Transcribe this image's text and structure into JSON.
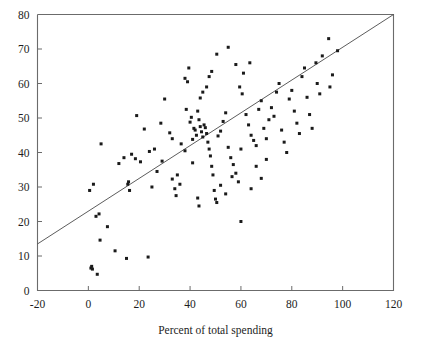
{
  "chart_data": {
    "type": "scatter",
    "title": "",
    "xlabel": "Percent of total spending",
    "ylabel": "",
    "xlim": [
      -20,
      120
    ],
    "ylim": [
      0,
      80
    ],
    "xticks": [
      -20,
      0,
      20,
      40,
      60,
      80,
      100,
      120
    ],
    "yticks": [
      0,
      10,
      20,
      30,
      40,
      50,
      60,
      70,
      80
    ],
    "xtick_labels": [
      "-20",
      "0",
      "20",
      "40",
      "60",
      "80",
      "100",
      "120"
    ],
    "ytick_labels": [
      "0",
      "10",
      "20",
      "30",
      "40",
      "50",
      "60",
      "70",
      "80"
    ],
    "grid": false,
    "legend": false,
    "marker": "square",
    "marker_size": 3,
    "marker_color": "#1a1a1a",
    "axis_color": "#6b6b6b",
    "fit_line": {
      "label": "regression line",
      "color": "#4a4a4a",
      "x0": -20,
      "y0": 13.5,
      "x1": 120,
      "y1": 80.0,
      "slope": 0.475,
      "intercept": 23.0
    },
    "points": [
      [
        0.5,
        29.0
      ],
      [
        1.0,
        6.5
      ],
      [
        1.3,
        7.0
      ],
      [
        1.6,
        6.2
      ],
      [
        2.0,
        30.8
      ],
      [
        3.5,
        4.7
      ],
      [
        3.0,
        21.5
      ],
      [
        4.2,
        22.2
      ],
      [
        4.6,
        14.6
      ],
      [
        5.0,
        42.5
      ],
      [
        7.5,
        18.5
      ],
      [
        10.5,
        11.5
      ],
      [
        12.0,
        36.8
      ],
      [
        14.0,
        38.5
      ],
      [
        15.0,
        9.3
      ],
      [
        15.5,
        30.8
      ],
      [
        15.8,
        31.5
      ],
      [
        16.2,
        29.0
      ],
      [
        17.0,
        39.5
      ],
      [
        18.5,
        38.2
      ],
      [
        19.0,
        50.7
      ],
      [
        20.5,
        37.3
      ],
      [
        22.0,
        46.8
      ],
      [
        23.5,
        9.7
      ],
      [
        24.0,
        40.3
      ],
      [
        26.0,
        41.0
      ],
      [
        28.5,
        48.5
      ],
      [
        30.0,
        55.5
      ],
      [
        32.0,
        45.7
      ],
      [
        33.0,
        32.3
      ],
      [
        34.0,
        29.5
      ],
      [
        34.5,
        27.5
      ],
      [
        35.0,
        33.5
      ],
      [
        36.0,
        30.8
      ],
      [
        38.0,
        61.5
      ],
      [
        38.5,
        52.5
      ],
      [
        39.0,
        60.5
      ],
      [
        39.5,
        64.5
      ],
      [
        40.0,
        48.8
      ],
      [
        40.5,
        50.2
      ],
      [
        41.0,
        43.8
      ],
      [
        41.5,
        47.0
      ],
      [
        42.0,
        46.5
      ],
      [
        42.5,
        45.0
      ],
      [
        43.0,
        52.0
      ],
      [
        43.5,
        49.5
      ],
      [
        44.0,
        47.5
      ],
      [
        44.5,
        46.0
      ],
      [
        45.0,
        44.5
      ],
      [
        45.5,
        48.0
      ],
      [
        46.0,
        47.2
      ],
      [
        46.5,
        45.5
      ],
      [
        47.0,
        43.0
      ],
      [
        47.5,
        41.0
      ],
      [
        48.0,
        39.0
      ],
      [
        48.5,
        36.0
      ],
      [
        49.0,
        33.5
      ],
      [
        49.5,
        29.0
      ],
      [
        50.0,
        26.5
      ],
      [
        50.5,
        25.5
      ],
      [
        44.0,
        55.8
      ],
      [
        45.0,
        57.5
      ],
      [
        46.5,
        59.0
      ],
      [
        47.5,
        62.0
      ],
      [
        48.5,
        63.5
      ],
      [
        51.0,
        44.8
      ],
      [
        52.0,
        46.2
      ],
      [
        53.0,
        49.0
      ],
      [
        54.0,
        51.5
      ],
      [
        55.0,
        41.5
      ],
      [
        56.0,
        38.5
      ],
      [
        57.0,
        36.5
      ],
      [
        58.0,
        34.0
      ],
      [
        59.0,
        31.5
      ],
      [
        60.0,
        20.0
      ],
      [
        59.5,
        59.0
      ],
      [
        60.5,
        57.0
      ],
      [
        61.0,
        63.0
      ],
      [
        62.0,
        51.0
      ],
      [
        63.0,
        48.0
      ],
      [
        64.0,
        45.0
      ],
      [
        65.0,
        43.5
      ],
      [
        66.0,
        42.0
      ],
      [
        67.0,
        52.5
      ],
      [
        68.0,
        55.0
      ],
      [
        69.0,
        47.0
      ],
      [
        70.0,
        44.0
      ],
      [
        71.0,
        49.5
      ],
      [
        72.0,
        53.0
      ],
      [
        73.0,
        50.5
      ],
      [
        74.0,
        57.5
      ],
      [
        75.0,
        60.0
      ],
      [
        76.0,
        46.5
      ],
      [
        77.0,
        43.0
      ],
      [
        78.0,
        40.0
      ],
      [
        79.0,
        55.5
      ],
      [
        80.0,
        58.0
      ],
      [
        81.0,
        52.0
      ],
      [
        82.0,
        48.5
      ],
      [
        83.0,
        45.5
      ],
      [
        84.0,
        62.0
      ],
      [
        85.0,
        64.5
      ],
      [
        86.0,
        56.0
      ],
      [
        87.0,
        51.0
      ],
      [
        88.0,
        47.0
      ],
      [
        89.5,
        66.0
      ],
      [
        90.0,
        60.0
      ],
      [
        91.0,
        57.0
      ],
      [
        92.0,
        68.0
      ],
      [
        94.5,
        73.0
      ],
      [
        95.0,
        59.0
      ],
      [
        96.0,
        62.5
      ],
      [
        98.0,
        69.5
      ],
      [
        33.0,
        44.0
      ],
      [
        36.5,
        42.5
      ],
      [
        29.0,
        37.5
      ],
      [
        27.0,
        34.5
      ],
      [
        25.0,
        30.0
      ],
      [
        43.0,
        26.8
      ],
      [
        43.5,
        24.5
      ],
      [
        52.0,
        30.5
      ],
      [
        54.0,
        28.0
      ],
      [
        56.5,
        33.0
      ],
      [
        64.0,
        29.5
      ],
      [
        68.0,
        32.5
      ],
      [
        58.0,
        65.5
      ],
      [
        63.5,
        66.0
      ],
      [
        50.5,
        68.5
      ],
      [
        55.0,
        70.5
      ],
      [
        41.0,
        37.0
      ],
      [
        38.0,
        40.5
      ],
      [
        60.0,
        41.0
      ],
      [
        66.0,
        36.0
      ],
      [
        70.0,
        38.0
      ]
    ]
  },
  "axis": {
    "x_title": "Percent of total spending"
  }
}
